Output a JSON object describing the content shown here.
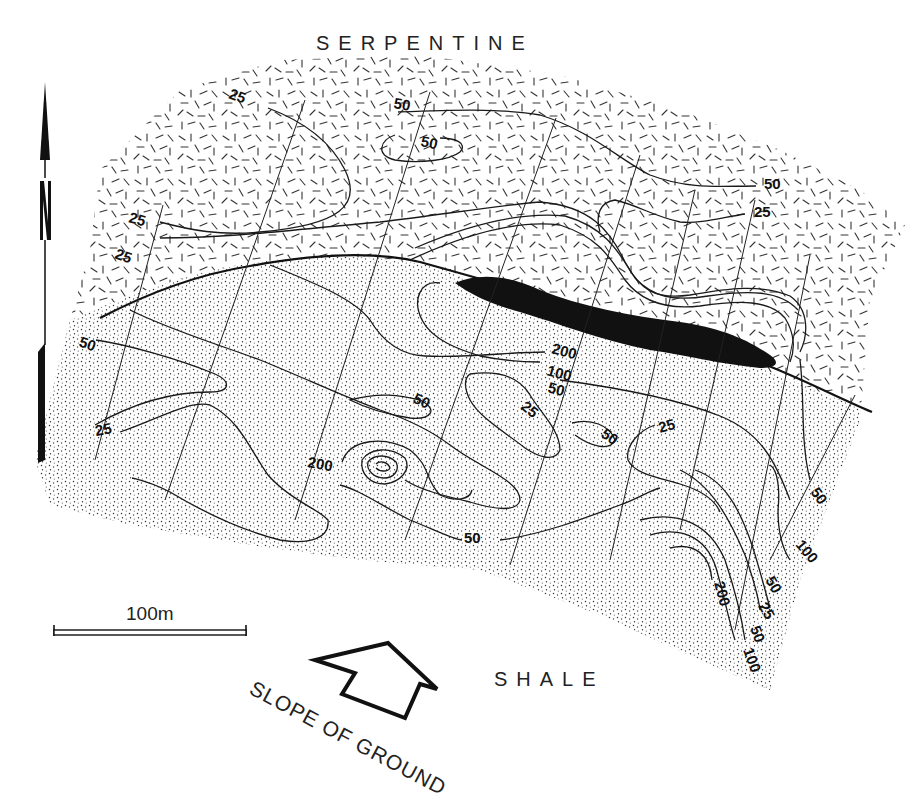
{
  "figure": {
    "type": "geochemical soil contour map",
    "regions": {
      "top": "SERPENTINE",
      "bottom": "SHALE"
    },
    "north_arrow": {
      "label": "N",
      "icon": "north-arrow-icon"
    },
    "scale_bar": {
      "label": "100m",
      "length_px": 192
    },
    "slope_indicator": {
      "label": "SLOPE OF GROUND",
      "icon": "slope-arrow-icon"
    },
    "colors": {
      "ink": "#111111",
      "background": "#ffffff",
      "ore_body": "#111111"
    },
    "contour_values": [
      25,
      50,
      100,
      200
    ],
    "contour_labels": [
      {
        "id": "c1",
        "value": "25",
        "x": 228,
        "y": 98,
        "rot": 20
      },
      {
        "id": "c2",
        "value": "50",
        "x": 393,
        "y": 108,
        "rot": 10
      },
      {
        "id": "c3",
        "value": "50",
        "x": 420,
        "y": 146,
        "rot": 12
      },
      {
        "id": "c4",
        "value": "50",
        "x": 764,
        "y": 189,
        "rot": 0
      },
      {
        "id": "c5",
        "value": "25",
        "x": 754,
        "y": 217,
        "rot": 0
      },
      {
        "id": "c6",
        "value": "25",
        "x": 128,
        "y": 222,
        "rot": 15
      },
      {
        "id": "c7",
        "value": "25",
        "x": 114,
        "y": 258,
        "rot": 20
      },
      {
        "id": "c8",
        "value": "50",
        "x": 78,
        "y": 346,
        "rot": 20
      },
      {
        "id": "c9",
        "value": "200",
        "x": 551,
        "y": 353,
        "rot": 15
      },
      {
        "id": "c10",
        "value": "100",
        "x": 546,
        "y": 375,
        "rot": 15
      },
      {
        "id": "c11",
        "value": "50",
        "x": 547,
        "y": 392,
        "rot": 15
      },
      {
        "id": "c12",
        "value": "50",
        "x": 412,
        "y": 402,
        "rot": 25
      },
      {
        "id": "c13",
        "value": "25",
        "x": 520,
        "y": 408,
        "rot": 40
      },
      {
        "id": "c14",
        "value": "50",
        "x": 600,
        "y": 436,
        "rot": 35
      },
      {
        "id": "c15",
        "value": "25",
        "x": 660,
        "y": 433,
        "rot": -15
      },
      {
        "id": "c16",
        "value": "25",
        "x": 96,
        "y": 436,
        "rot": -10
      },
      {
        "id": "c17",
        "value": "200",
        "x": 307,
        "y": 467,
        "rot": 10
      },
      {
        "id": "c18",
        "value": "50",
        "x": 810,
        "y": 492,
        "rot": 55
      },
      {
        "id": "c19",
        "value": "100",
        "x": 795,
        "y": 545,
        "rot": 50
      },
      {
        "id": "c20",
        "value": "50",
        "x": 464,
        "y": 543,
        "rot": 0
      },
      {
        "id": "c21",
        "value": "50",
        "x": 765,
        "y": 580,
        "rot": 60
      },
      {
        "id": "c22",
        "value": "25",
        "x": 758,
        "y": 606,
        "rot": 60
      },
      {
        "id": "c23",
        "value": "200",
        "x": 714,
        "y": 583,
        "rot": 75
      },
      {
        "id": "c24",
        "value": "50",
        "x": 750,
        "y": 628,
        "rot": 70
      },
      {
        "id": "c25",
        "value": "100",
        "x": 743,
        "y": 650,
        "rot": 70
      }
    ]
  }
}
